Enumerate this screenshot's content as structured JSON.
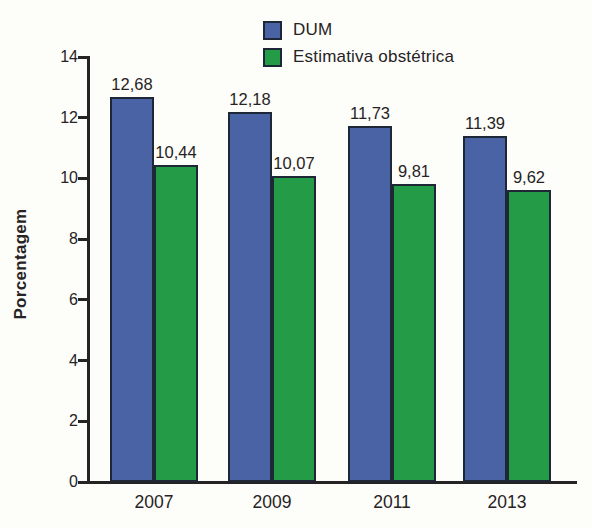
{
  "chart_data": {
    "type": "bar",
    "title": "",
    "xlabel": "",
    "ylabel": "Porcentagem",
    "ylim": [
      0,
      14
    ],
    "yticks": [
      0,
      2,
      4,
      6,
      8,
      10,
      12,
      14
    ],
    "grid": false,
    "legend_position": "top-center",
    "categories": [
      "2007",
      "2009",
      "2011",
      "2013"
    ],
    "series": [
      {
        "name": "DUM",
        "color": "#4a63a5",
        "values": [
          12.68,
          12.18,
          11.73,
          11.39
        ],
        "value_labels": [
          "12,68",
          "12,18",
          "11,73",
          "11,39"
        ]
      },
      {
        "name": "Estimativa obstétrica",
        "color": "#239b47",
        "values": [
          10.44,
          10.07,
          9.81,
          9.62
        ],
        "value_labels": [
          "10,44",
          "10,07",
          "9,81",
          "9,62"
        ]
      }
    ],
    "bar_outline_color": "#1e2735",
    "axis_color": "#262324",
    "text_color": "#262324",
    "background_color": "#fdfdfa"
  }
}
